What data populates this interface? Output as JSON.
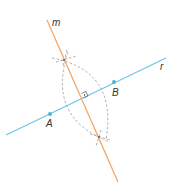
{
  "diagram": {
    "type": "geometric-construction",
    "colors": {
      "line_r": "#6ec6e6",
      "line_m": "#f0a868",
      "points": "#4ab4dc",
      "construction_arcs": "#999999",
      "labels": "#333333"
    },
    "lines": [
      {
        "name": "m",
        "label": "m"
      },
      {
        "name": "r",
        "label": "r"
      }
    ],
    "points": [
      {
        "name": "A",
        "label": "A"
      },
      {
        "name": "B",
        "label": "B"
      }
    ],
    "right_angle_marker": true
  }
}
